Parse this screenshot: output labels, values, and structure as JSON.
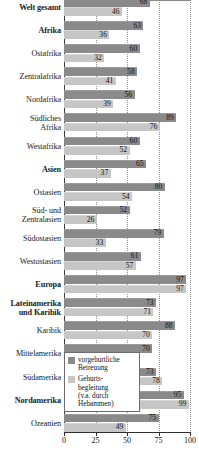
{
  "chart_data": {
    "type": "bar",
    "orientation": "horizontal",
    "title": "",
    "xlabel": "",
    "ylabel": "",
    "xlim": [
      0,
      100
    ],
    "xticks": [
      0,
      25,
      50,
      75,
      100
    ],
    "xtick_labels": [
      "0",
      "25",
      "50",
      "75",
      "100"
    ],
    "grid": true,
    "grid_axis": "x",
    "legend_position": "inside-lower-left",
    "categories": [
      "Welt gesamt",
      "Afrika",
      "Ostafrika",
      "Zentralafrika",
      "Nordafrika",
      "Südliches\nAfrika",
      "Westafrika",
      "Asien",
      "Ostasien",
      "Süd- und\nZentralasien",
      "Südostasien",
      "Westostasien",
      "Europa",
      "Lateinamerika\nund Karibik",
      "Karibik",
      "Mittelamerika",
      "Südamerika",
      "Nordamerika",
      "Ozeanien"
    ],
    "emphasized_categories": [
      "Welt gesamt",
      "Afrika",
      "Asien",
      "Europa",
      "Lateinamerika\nund Karibik",
      "Nordamerika"
    ],
    "series": [
      {
        "name": "vorgeburtliche\nBetreuung",
        "color": "#8a8a8a",
        "values": [
          68,
          63,
          60,
          58,
          56,
          89,
          60,
          65,
          80,
          52,
          79,
          61,
          97,
          73,
          88,
          70,
          73,
          95,
          75
        ]
      },
      {
        "name": "Geburts-\nbegleitung\n(v.a. durch\nHebammen)",
        "color": "#c6c6c6",
        "values": [
          46,
          36,
          32,
          41,
          39,
          76,
          52,
          37,
          54,
          26,
          33,
          57,
          97,
          71,
          70,
          58,
          78,
          99,
          49
        ]
      }
    ]
  },
  "legend": {
    "items": [
      {
        "label": "vorgeburtliche\nBetreuung",
        "swatch": "dark"
      },
      {
        "label": "Geburts-\nbegleitung\n(v.a. durch\nHebammen)",
        "swatch": "light"
      }
    ]
  },
  "caption": {
    "text": ""
  },
  "colors": {
    "series_prenatal": "#8a8a8a",
    "series_birth": "#c6c6c6",
    "axis": "#2e2e2e",
    "gridline": "#8f8f8f",
    "text": "#111111",
    "background": "#ffffff"
  }
}
